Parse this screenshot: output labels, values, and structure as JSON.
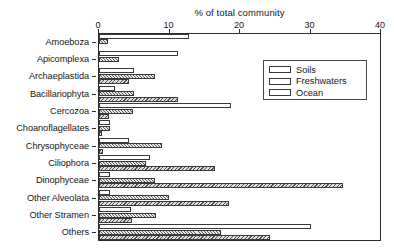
{
  "chart_data": {
    "type": "bar",
    "orientation": "horizontal",
    "title": "% of total community",
    "xlabel": "% of total community",
    "ylabel": "",
    "xlim": [
      0,
      40
    ],
    "xticks": [
      0,
      10,
      20,
      30,
      40
    ],
    "xtick_labels": [
      "0",
      "10",
      "20",
      "30",
      "40"
    ],
    "grid": false,
    "legend_position": "top-right",
    "categories": [
      "Amoeboza",
      "Apicomplexa",
      "Archaeplastida",
      "Bacillariophyta",
      "Cercozoa",
      "Choanoflagellates",
      "Chrysophyceae",
      "Ciliophora",
      "Dinophyceae",
      "Other Alveolata",
      "Other Stramen",
      "Others"
    ],
    "series": [
      {
        "name": "Soils",
        "fill": "open-white",
        "color": "#ffffff",
        "values": [
          12.7,
          11.2,
          4.9,
          2.3,
          18.7,
          1.6,
          4.3,
          7.3,
          1.5,
          1.5,
          4.5,
          30.0
        ]
      },
      {
        "name": "Freshwaters",
        "fill": "fine-hatch",
        "color": "#5a5a5a",
        "values": [
          1.3,
          2.8,
          8.0,
          4.9,
          4.8,
          1.6,
          8.9,
          6.7,
          7.9,
          9.9,
          8.1,
          17.3
        ]
      },
      {
        "name": "Ocean",
        "fill": "coarse-hatch",
        "color": "#4f4f4f",
        "values": [
          0.0,
          0.0,
          4.2,
          11.2,
          1.4,
          0.4,
          0.5,
          16.5,
          34.6,
          18.5,
          4.7,
          24.3
        ]
      }
    ]
  },
  "legend": {
    "entries": [
      {
        "label": "Soils"
      },
      {
        "label": "Freshwaters"
      },
      {
        "label": "Ocean"
      }
    ]
  }
}
